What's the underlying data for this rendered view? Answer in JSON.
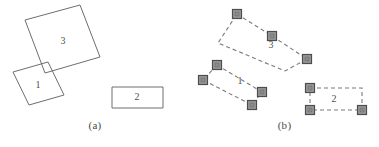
{
  "figure": {
    "width": 379,
    "height": 147,
    "background": "#ffffff",
    "stroke_color": "#6e6e6e",
    "dashed_stroke_color": "#7a7a7a",
    "marker_fill": "#9a9a9a",
    "marker_stroke": "#4d4d4d",
    "label_color": "#4f4f4f"
  },
  "panels": [
    {
      "id": "a",
      "caption": "(a)",
      "caption_x": 85,
      "caption_y": 128,
      "shapes": [
        {
          "name": "rect-3",
          "label": "3",
          "label_x": 63,
          "label_y": 44,
          "style": "solid",
          "points": [
            [
              25,
              20
            ],
            [
              80,
              5
            ],
            [
              100,
              57
            ],
            [
              45,
              73
            ]
          ]
        },
        {
          "name": "rect-1",
          "label": "1",
          "label_x": 38,
          "label_y": 88,
          "style": "solid",
          "points": [
            [
              13,
              72
            ],
            [
              48,
              62
            ],
            [
              64,
              95
            ],
            [
              29,
              105
            ]
          ]
        },
        {
          "name": "rect-2",
          "label": "2",
          "label_x": 137,
          "label_y": 100,
          "style": "solid",
          "points": [
            [
              112,
              87
            ],
            [
              163,
              87
            ],
            [
              163,
              108
            ],
            [
              112,
              108
            ]
          ]
        }
      ]
    },
    {
      "id": "b",
      "caption": "(b)",
      "caption_x": 85,
      "caption_y": 128,
      "shapes": [
        {
          "name": "rect-3",
          "label": "3",
          "label_x": 81,
          "label_y": 48,
          "style": "dashed",
          "points": [
            [
              47,
              14
            ],
            [
              82,
              36
            ],
            [
              117,
              59
            ],
            [
              95,
              71
            ],
            [
              28,
              43
            ]
          ],
          "markers": [
            [
              47,
              14
            ],
            [
              82,
              36
            ],
            [
              117,
              59
            ]
          ]
        },
        {
          "name": "rect-1",
          "label": "1",
          "label_x": 50,
          "label_y": 84,
          "style": "dashed",
          "points": [
            [
              27,
              65
            ],
            [
              72,
              92
            ],
            [
              62,
              105
            ],
            [
              13,
              80
            ]
          ],
          "markers": [
            [
              27,
              65
            ],
            [
              72,
              92
            ],
            [
              62,
              105
            ],
            [
              13,
              80
            ]
          ]
        },
        {
          "name": "rect-2",
          "label": "2",
          "label_x": 144,
          "label_y": 102,
          "style": "dashed",
          "points": [
            [
              120,
              88
            ],
            [
              172,
              88
            ],
            [
              172,
              110
            ],
            [
              120,
              110
            ]
          ],
          "markers": [
            [
              120,
              88
            ],
            [
              120,
              110
            ],
            [
              172,
              110
            ]
          ]
        }
      ]
    }
  ]
}
